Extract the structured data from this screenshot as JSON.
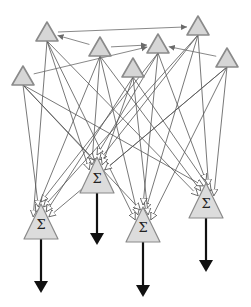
{
  "diagram": {
    "type": "fully-connected-network",
    "colors": {
      "node_fill": "#d6d6d6",
      "node_stroke": "#8a8a8a",
      "edge": "#555555",
      "output_arrow": "#111111"
    },
    "inputs": [
      {
        "id": "in1",
        "apex": [
          47,
          22
        ],
        "half_width": 11,
        "height": 19
      },
      {
        "id": "in2",
        "apex": [
          100,
          37
        ],
        "half_width": 11,
        "height": 19
      },
      {
        "id": "in3",
        "apex": [
          23,
          66
        ],
        "half_width": 11,
        "height": 19
      },
      {
        "id": "in4",
        "apex": [
          158,
          34
        ],
        "half_width": 11,
        "height": 19
      },
      {
        "id": "in5",
        "apex": [
          198,
          16
        ],
        "half_width": 11,
        "height": 19
      },
      {
        "id": "in6",
        "apex": [
          133,
          58
        ],
        "half_width": 11,
        "height": 19
      },
      {
        "id": "in7",
        "apex": [
          227,
          48
        ],
        "half_width": 11,
        "height": 19
      }
    ],
    "sums": [
      {
        "id": "sum1",
        "label": "Σ",
        "apex": [
          41,
          204
        ],
        "half_width": 17,
        "height": 35,
        "arrow_end_y": 293
      },
      {
        "id": "sum2",
        "label": "Σ",
        "apex": [
          97,
          157
        ],
        "half_width": 17,
        "height": 36,
        "arrow_end_y": 245
      },
      {
        "id": "sum3",
        "label": "Σ",
        "apex": [
          143,
          207
        ],
        "half_width": 17,
        "height": 35,
        "arrow_end_y": 297
      },
      {
        "id": "sum4",
        "label": "Σ",
        "apex": [
          206,
          183
        ],
        "half_width": 17,
        "height": 35,
        "arrow_end_y": 272
      }
    ],
    "lateral_edges": [
      {
        "from": "in1",
        "to": "in5"
      },
      {
        "from": "in2",
        "to": "in1"
      },
      {
        "from": "in3",
        "to": "in4"
      },
      {
        "from": "in2",
        "to": "in4"
      },
      {
        "from": "in7",
        "to": "in4"
      }
    ],
    "connections": "all-inputs-to-all-sums"
  }
}
